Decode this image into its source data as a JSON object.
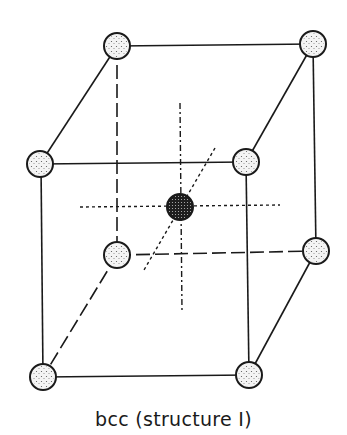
{
  "diagram": {
    "caption": "bcc (structure I)",
    "lattice_type": "body-centered cubic",
    "colors": {
      "line": "#1a1a1a",
      "atom_fill": "#f4f4f4",
      "center_atom_fill": "#1e1e1e",
      "background": "#ffffff"
    },
    "atoms": [
      {
        "id": "top-back-left",
        "kind": "corner"
      },
      {
        "id": "top-back-right",
        "kind": "corner"
      },
      {
        "id": "top-front-left",
        "kind": "corner"
      },
      {
        "id": "top-front-right",
        "kind": "corner"
      },
      {
        "id": "bottom-back-left",
        "kind": "corner"
      },
      {
        "id": "bottom-back-right",
        "kind": "corner"
      },
      {
        "id": "bottom-front-left",
        "kind": "corner"
      },
      {
        "id": "bottom-front-right",
        "kind": "corner"
      },
      {
        "id": "body-center",
        "kind": "center"
      }
    ]
  }
}
